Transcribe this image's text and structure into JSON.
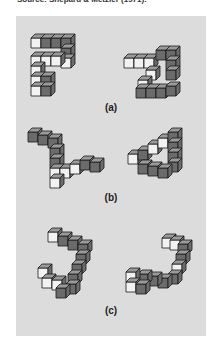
{
  "caption": {
    "source": "Source: Shepard & Metzler (1971)."
  },
  "figure": {
    "panels": [
      {
        "id": "a",
        "label": "(a)",
        "description": "Two 3D cube-block figures, same object at different rotation (picture plane)"
      },
      {
        "id": "b",
        "label": "(b)",
        "description": "Two 3D cube-block figures, same object rotated in depth"
      },
      {
        "id": "c",
        "label": "(c)",
        "description": "Two 3D cube-block figures, different (mirror) objects"
      }
    ],
    "colors": {
      "background": "#dcdcdc",
      "face_dark": "#6b6b6b",
      "face_mid": "#9a9a9a",
      "face_light": "#f2f2f2",
      "edge": "#1a1a1a"
    }
  }
}
